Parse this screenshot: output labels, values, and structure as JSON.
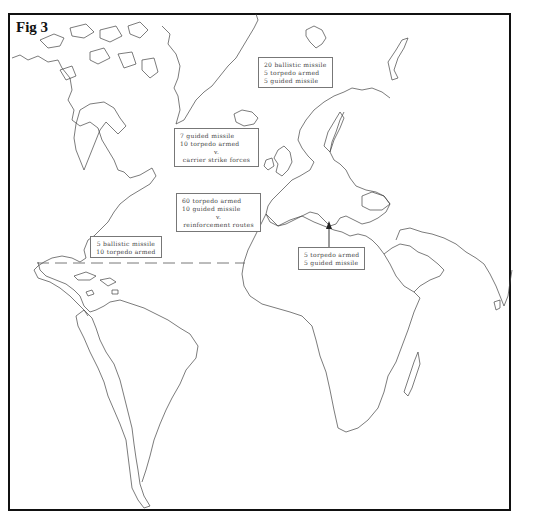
{
  "figure": {
    "title": "Fig 3"
  },
  "annotations": [
    {
      "id": "norwegian-sea",
      "lines": [
        "20 ballistic missile",
        "5 torpedo armed",
        "5 guided missile"
      ]
    },
    {
      "id": "north-atlantic-gap",
      "lines": [
        "7 guided missile",
        "10 torpedo armed",
        "v.",
        "carrier strike forces"
      ]
    },
    {
      "id": "mid-atlantic",
      "lines": [
        "60 torpedo armed",
        "10 guided missile",
        "v.",
        "reinforcement routes"
      ]
    },
    {
      "id": "caribbean",
      "lines": [
        "5 ballistic missile",
        "10 torpedo armed"
      ]
    },
    {
      "id": "mediterranean",
      "lines": [
        "5 torpedo armed",
        "5 guided missile"
      ]
    }
  ],
  "map": {
    "region": "Atlantic Ocean with Americas, Europe and Africa",
    "dashed_line": "Atlantic boundary line at approx. Tropic of Cancer",
    "arrow": "Points from Mediterranean box into the Ionian Sea"
  }
}
